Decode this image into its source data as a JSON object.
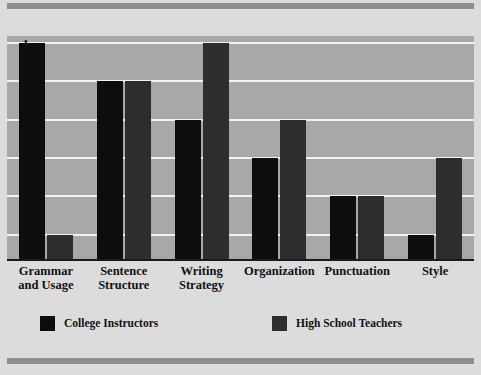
{
  "chart_data": {
    "type": "bar",
    "title": "",
    "subtitle": "",
    "xlabel": "",
    "ylabel": "",
    "categories": [
      "Grammar and Usage",
      "Sentence Structure",
      "Writing Strategy",
      "Organization",
      "Punctuation",
      "Style"
    ],
    "category_lines": [
      [
        "Grammar",
        "and Usage"
      ],
      [
        "Sentence",
        "Structure"
      ],
      [
        "Writing",
        "Strategy"
      ],
      [
        "Organization"
      ],
      [
        "Punctuation"
      ],
      [
        "Style"
      ]
    ],
    "series": [
      {
        "name": "College Instructors",
        "color": "#0d0d0d",
        "values": [
          1,
          2,
          3,
          4,
          5,
          6
        ]
      },
      {
        "name": "High School Teachers",
        "color": "#2d2d2d",
        "values": [
          6,
          2,
          1,
          3,
          5,
          4
        ]
      }
    ],
    "ytick_labels": [
      "1",
      "2",
      "3",
      "4",
      "5",
      "6"
    ],
    "ytick_values": [
      1,
      2,
      3,
      4,
      5,
      6
    ],
    "ylim": [
      1,
      6
    ],
    "y_axis_inverted": true,
    "grid": true,
    "gridline_color": "#f2f2f2",
    "plot_background": "#a8a8a8",
    "page_background": "#dcdcdc",
    "band_color": "#8e8e8e",
    "axis_color": "#1a1a1a",
    "legend_position": "bottom"
  },
  "legend": {
    "entries": [
      {
        "label": "College Instructors",
        "color": "#0d0d0d"
      },
      {
        "label": "High School Teachers",
        "color": "#2d2d2d"
      }
    ]
  }
}
